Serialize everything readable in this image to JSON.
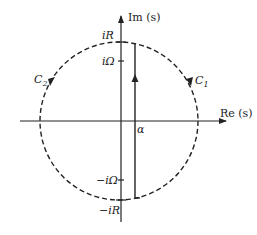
{
  "diagram": {
    "axes": {
      "real_label": "Re (s)",
      "imag_label": "Im (s)"
    },
    "imag_ticks": {
      "top_R": "iR",
      "top_Omega": "iΩ",
      "bottom_Omega": "−iΩ",
      "bottom_R": "−iR"
    },
    "real_tick": "α",
    "contours": {
      "right": "C",
      "right_sub": "1",
      "left": "C",
      "left_sub": "2"
    },
    "colors": {
      "stroke": "#222222",
      "background": "#ffffff"
    }
  }
}
